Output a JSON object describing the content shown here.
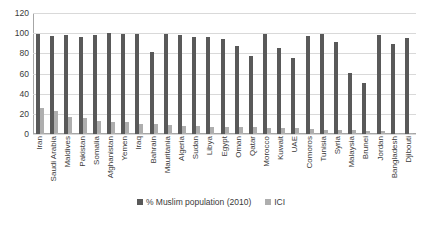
{
  "chart_data": {
    "type": "bar",
    "title": "",
    "xlabel": "",
    "ylabel": "",
    "ylim": [
      0,
      120
    ],
    "yticks": [
      0,
      20,
      40,
      60,
      80,
      100,
      120
    ],
    "grid": true,
    "legend_position": "bottom",
    "categories": [
      "Iran",
      "Saudi Arabia",
      "Maldives",
      "Pakistan",
      "Somalia",
      "Afghanistan",
      "Yemen",
      "Iraq",
      "Bahrain",
      "Mauritania",
      "Algeria",
      "Sudan",
      "Libya",
      "Egypt",
      "Oman",
      "Qatar",
      "Morocco",
      "Kuwait",
      "UAE",
      "Comoros",
      "Tunisia",
      "Syria",
      "Malaysia",
      "Brunei",
      "Jordan",
      "Bangladesh",
      "Djibouti"
    ],
    "series": [
      {
        "name": "% Muslim population (2010)",
        "color": "#595959",
        "values": [
          99.6,
          97.0,
          98.4,
          96.0,
          98.6,
          99.7,
          99.0,
          98.9,
          81.2,
          99.2,
          98.0,
          96.6,
          96.2,
          94.6,
          87.1,
          77.5,
          99.6,
          85.8,
          75.5,
          97.5,
          99.3,
          91.4,
          60.2,
          50.8,
          97.8,
          89.1,
          95.6
        ]
      },
      {
        "name": "ICI",
        "color": "#aeaeae",
        "values": [
          25.4,
          22.9,
          16.5,
          15.6,
          13.2,
          12.4,
          12.2,
          10.3,
          10.2,
          8.5,
          8.3,
          8.1,
          7.2,
          7.1,
          6.9,
          6.8,
          5.8,
          5.6,
          5.6,
          4.6,
          3.9,
          3.7,
          3.6,
          3.4,
          2.8,
          1.2,
          0.6
        ]
      }
    ]
  },
  "legend": {
    "items": [
      {
        "label": "% Muslim population (2010)",
        "color": "#595959"
      },
      {
        "label": "ICI",
        "color": "#aeaeae"
      }
    ]
  }
}
